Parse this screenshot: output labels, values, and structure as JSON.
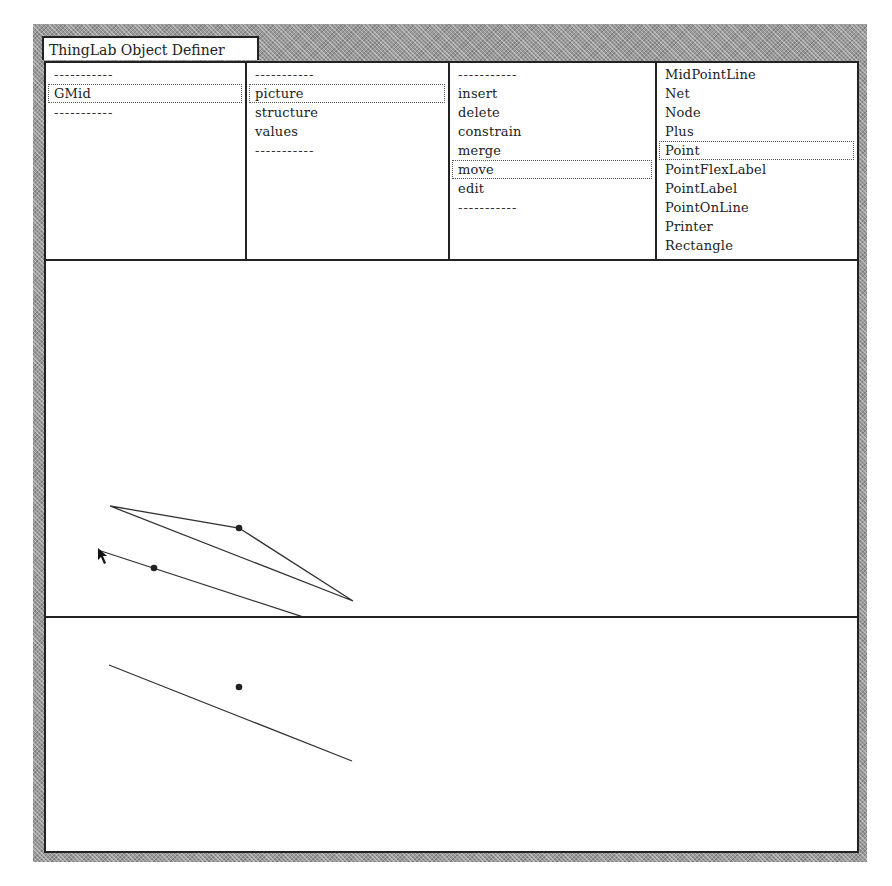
{
  "window": {
    "title": "ThingLab Object Definer"
  },
  "list_panes": [
    {
      "name": "classes",
      "items": [
        {
          "label": "-----------",
          "separator": true,
          "selected": false
        },
        {
          "label": "GMid",
          "separator": false,
          "selected": true
        },
        {
          "label": "-----------",
          "separator": true,
          "selected": false
        }
      ]
    },
    {
      "name": "views",
      "items": [
        {
          "label": "-----------",
          "separator": true,
          "selected": false
        },
        {
          "label": "picture",
          "separator": false,
          "selected": true
        },
        {
          "label": "structure",
          "separator": false,
          "selected": false
        },
        {
          "label": "values",
          "separator": false,
          "selected": false
        },
        {
          "label": "-----------",
          "separator": true,
          "selected": false
        }
      ]
    },
    {
      "name": "commands",
      "items": [
        {
          "label": "-----------",
          "separator": true,
          "selected": false
        },
        {
          "label": "insert",
          "separator": false,
          "selected": false
        },
        {
          "label": "delete",
          "separator": false,
          "selected": false
        },
        {
          "label": "constrain",
          "separator": false,
          "selected": false
        },
        {
          "label": "merge",
          "separator": false,
          "selected": false
        },
        {
          "label": "move",
          "separator": false,
          "selected": true
        },
        {
          "label": "edit",
          "separator": false,
          "selected": false
        },
        {
          "label": "-----------",
          "separator": true,
          "selected": false
        }
      ]
    },
    {
      "name": "prototypes",
      "items": [
        {
          "label": "MidPointLine",
          "separator": false,
          "selected": false
        },
        {
          "label": "Net",
          "separator": false,
          "selected": false
        },
        {
          "label": "Node",
          "separator": false,
          "selected": false
        },
        {
          "label": "Plus",
          "separator": false,
          "selected": false
        },
        {
          "label": "Point",
          "separator": false,
          "selected": true
        },
        {
          "label": "PointFlexLabel",
          "separator": false,
          "selected": false
        },
        {
          "label": "PointLabel",
          "separator": false,
          "selected": false
        },
        {
          "label": "PointOnLine",
          "separator": false,
          "selected": false
        },
        {
          "label": "Printer",
          "separator": false,
          "selected": false
        },
        {
          "label": "Rectangle",
          "separator": false,
          "selected": false
        }
      ]
    }
  ],
  "picture_pane": {
    "triangle": [
      [
        64,
        245
      ],
      [
        193,
        267
      ],
      [
        307,
        340
      ]
    ],
    "line": {
      "from": [
        52,
        289
      ],
      "to": [
        291,
        367
      ]
    },
    "point": [
      108,
      307
    ],
    "vertex_point": [
      193,
      267
    ],
    "cursor": {
      "icon": "arrow-cursor-icon",
      "at": [
        52,
        287
      ]
    }
  },
  "prototype_pane": {
    "line": {
      "from": [
        63,
        47
      ],
      "to": [
        306,
        143
      ]
    },
    "point": [
      193,
      69
    ]
  },
  "colors": {
    "ink": "#222222",
    "background": "#ffffff",
    "frame_gray": "#9a9a9a"
  }
}
